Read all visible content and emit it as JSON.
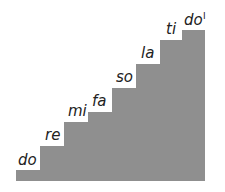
{
  "diagram": {
    "title": "",
    "fill_color": "#8f8f8f",
    "steps": [
      {
        "label": "do"
      },
      {
        "label": "re"
      },
      {
        "label": "mi"
      },
      {
        "label": "fa"
      },
      {
        "label": "so"
      },
      {
        "label": "la"
      },
      {
        "label": "ti"
      },
      {
        "label": "do",
        "superscript": "I"
      }
    ]
  }
}
